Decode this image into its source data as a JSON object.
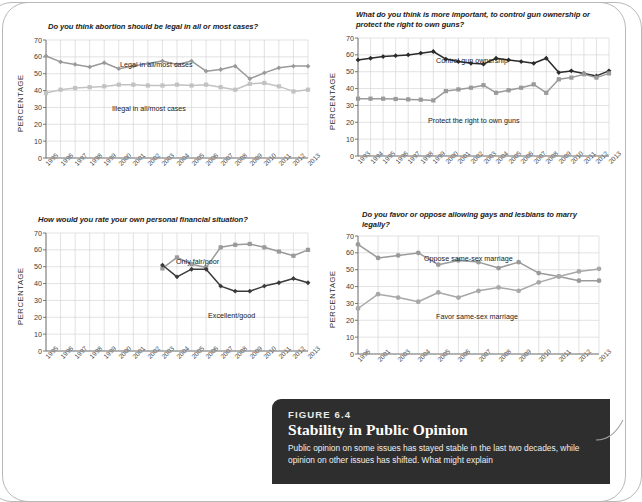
{
  "figure": {
    "label": "FIGURE 6.4",
    "title": "Stability in Public Opinion",
    "body": "Public opinion on some issues has stayed stable in the last two decades, while opinion on other issues has shifted. What might explain"
  },
  "axis": {
    "ylabel": "PERCENTAGE",
    "yticks": [
      "70",
      "60",
      "50",
      "40",
      "30",
      "20",
      "10",
      "0"
    ]
  },
  "chart_data": [
    {
      "id": "abortion",
      "type": "line",
      "title": "Do you think abortion should be legal in all or most cases?",
      "xlabel": "",
      "ylabel": "PERCENTAGE",
      "ylim": [
        0,
        70
      ],
      "grid": true,
      "legend_position": "inline-annotation",
      "categories": [
        "1995",
        "1996",
        "1997",
        "1998",
        "1999",
        "2000",
        "2001",
        "2002",
        "2003",
        "2004",
        "2005",
        "2006",
        "2007",
        "2008",
        "2009",
        "2010",
        "2011",
        "2012",
        "2013"
      ],
      "series": [
        {
          "name": "Legal in all/most cases",
          "color": "#9a9a9a",
          "marker": "diamond",
          "values": [
            60.5,
            57,
            55.5,
            54,
            56.5,
            53,
            54.5,
            56,
            57.5,
            55.5,
            57.5,
            51.5,
            52.5,
            54.5,
            47,
            50.5,
            53.5,
            54.5,
            54.5
          ]
        },
        {
          "name": "Illegal in all/most cases",
          "color": "#c2c2c2",
          "marker": "square",
          "values": [
            38.5,
            40.5,
            41.5,
            42,
            42.5,
            43.5,
            43.5,
            43,
            43,
            43.5,
            43,
            43.5,
            42,
            40.5,
            44,
            44.5,
            42.5,
            39.5,
            40.5
          ]
        }
      ]
    },
    {
      "id": "guns",
      "type": "line",
      "title": "What do you think is more important, to control gun ownership or protect the right to own guns?",
      "xlabel": "",
      "ylabel": "PERCENTAGE",
      "ylim": [
        0,
        70
      ],
      "grid": true,
      "legend_position": "inline-annotation",
      "categories": [
        "1993",
        "1994",
        "1995",
        "1996",
        "1997",
        "1998",
        "1999",
        "2000",
        "2001",
        "2002",
        "2003",
        "2004",
        "2005",
        "2006",
        "2007",
        "2008",
        "2009",
        "2010",
        "2011",
        "2012",
        "2013"
      ],
      "series": [
        {
          "name": "Control gun ownership",
          "color": "#2b2b2b",
          "marker": "diamond",
          "values": [
            57,
            58,
            59,
            59.5,
            60,
            61,
            62,
            57.5,
            56,
            55,
            54.5,
            58,
            57,
            56,
            55,
            58,
            49.5,
            50.5,
            49,
            47.5,
            50.5
          ]
        },
        {
          "name": "Protect the right to own guns",
          "color": "#9a9a9a",
          "marker": "square",
          "values": [
            34,
            34,
            34,
            33.8,
            33.6,
            33.4,
            33,
            38.5,
            39.5,
            40.5,
            42,
            37.5,
            39,
            40.5,
            42.5,
            37.5,
            45.5,
            46.5,
            48.5,
            46.5,
            49
          ]
        }
      ]
    },
    {
      "id": "finance",
      "type": "line",
      "title": "How would you rate your own personal financial situation?",
      "xlabel": "",
      "ylabel": "PERCENTAGE",
      "ylim": [
        0,
        70
      ],
      "grid": true,
      "legend_position": "inline-annotation",
      "categories": [
        "1995",
        "1996",
        "1997",
        "1998",
        "1999",
        "2000",
        "2001",
        "2002",
        "2003",
        "2004",
        "2005",
        "2006",
        "2007",
        "2008",
        "2009",
        "2010",
        "2011",
        "2012",
        "2013"
      ],
      "series": [
        {
          "name": "Only fair/poor",
          "color": "#9a9a9a",
          "marker": "square",
          "values": [
            null,
            null,
            null,
            null,
            null,
            null,
            null,
            null,
            49,
            55.5,
            51.5,
            49.5,
            61.5,
            63,
            63.5,
            61.5,
            59,
            56.5,
            60
          ]
        },
        {
          "name": "Excellent/good",
          "color": "#3a3a3a",
          "marker": "diamond",
          "values": [
            null,
            null,
            null,
            null,
            null,
            null,
            null,
            null,
            51,
            44,
            48.5,
            48.5,
            38.5,
            35.5,
            35.5,
            38.5,
            40.5,
            43,
            40.5
          ]
        }
      ]
    },
    {
      "id": "marriage",
      "type": "line",
      "title": "Do you favor or oppose allowing gays and lesbians to marry legally?",
      "xlabel": "",
      "ylabel": "PERCENTAGE",
      "ylim": [
        0,
        70
      ],
      "grid": true,
      "legend_position": "inline-annotation",
      "categories": [
        "1996",
        "2001",
        "2003",
        "2004",
        "2005",
        "2006",
        "2007",
        "2008",
        "2009",
        "2010",
        "2011",
        "2012",
        "2013"
      ],
      "series": [
        {
          "name": "Oppose same-sex marriage",
          "color": "#9a9a9a",
          "marker": "circle",
          "values": [
            65,
            57,
            58.5,
            60,
            53,
            55.5,
            54.5,
            51,
            54.5,
            48,
            46,
            43.5,
            43.5
          ]
        },
        {
          "name": "Favor same-sex marriage",
          "color": "#a8a8a8",
          "marker": "circle",
          "values": [
            27,
            35.5,
            33.5,
            31,
            36.5,
            33.5,
            37.5,
            39.5,
            37.5,
            42.5,
            46,
            49,
            50.5
          ]
        }
      ]
    }
  ]
}
